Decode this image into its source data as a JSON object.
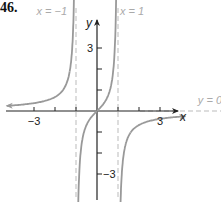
{
  "problem_label": "46.",
  "chart_data": {
    "type": "line",
    "title": "",
    "xlabel": "x",
    "ylabel": "y",
    "xlim": [
      -4.5,
      5.5
    ],
    "ylim": [
      -4.3,
      5.3
    ],
    "x_ticks": [
      -3,
      -2,
      -1,
      1,
      2,
      3
    ],
    "x_tick_labels": [
      "-3",
      "3"
    ],
    "y_ticks": [
      -3,
      -2,
      -1,
      1,
      2,
      3
    ],
    "y_tick_labels": [
      "-3",
      "3"
    ],
    "grid": false,
    "function": "y = x / (1 - x^2)",
    "asymptotes": [
      {
        "type": "vertical",
        "label": "x = -1",
        "value": -1
      },
      {
        "type": "vertical",
        "label": "x = 1",
        "value": 1
      },
      {
        "type": "horizontal",
        "label": "y = 0",
        "value": 0
      }
    ],
    "series": [
      {
        "name": "left branch",
        "x": [
          -4.2,
          -3,
          -2,
          -1.5,
          -1.2,
          -1.08
        ],
        "y": [
          0.25,
          0.375,
          0.67,
          1.2,
          2.73,
          6.5
        ]
      },
      {
        "name": "middle branch",
        "x": [
          -0.92,
          -0.8,
          -0.5,
          0,
          0.5,
          0.8,
          0.92
        ],
        "y": [
          -6.2,
          -2.22,
          -0.67,
          0,
          0.67,
          2.22,
          6.2
        ]
      },
      {
        "name": "right branch",
        "x": [
          1.08,
          1.2,
          1.5,
          2,
          3,
          4.2
        ],
        "y": [
          -6.5,
          -2.73,
          -1.2,
          -0.67,
          -0.375,
          -0.25
        ]
      }
    ]
  },
  "labels": {
    "asym_left": "x = −1",
    "asym_right": "x = 1",
    "asym_h": "y = 0",
    "x_axis": "x",
    "y_axis": "y",
    "tick_neg3_x": "−3",
    "tick_3_x": "3",
    "tick_3_y": "3",
    "tick_neg3_y": "−3"
  }
}
